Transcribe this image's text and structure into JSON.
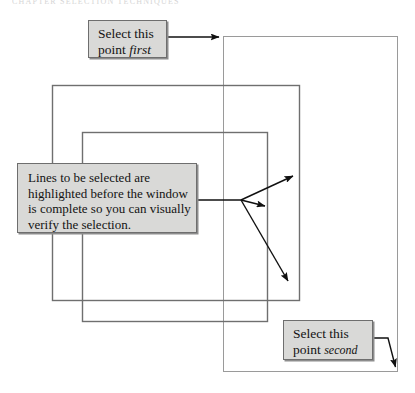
{
  "figure": {
    "ghost_header": "CHAPTER  SELECTION  TECHNIQUES",
    "callout_first": {
      "line1": "Select this",
      "line2_prefix": "point ",
      "line2_emphasis": "first"
    },
    "callout_second": {
      "line1": "Select this",
      "line2_prefix": "point ",
      "line2_emphasis": "second"
    },
    "callout_lines": {
      "line1": "Lines to be selected are",
      "line2": "highlighted before the window",
      "line3": "is complete so you can visually",
      "line4": "verify the selection."
    },
    "colors": {
      "page_background": "#ffffff",
      "callout_fill": "#d9d9d7",
      "callout_border": "#6e6e6e",
      "callout_shadow": "#8d8d8d",
      "window_stroke": "#6f6f6f",
      "selection_stroke": "#9a9a9a",
      "arrow_stroke": "#101010"
    },
    "shapes": {
      "selection_window": {
        "x": 223,
        "y": 36,
        "width": 175,
        "height": 336
      },
      "window_back": {
        "x": 52,
        "y": 85,
        "width": 248,
        "height": 216
      },
      "window_front": {
        "x": 82,
        "y": 132,
        "width": 186,
        "height": 190
      }
    },
    "arrows": {
      "first_point": {
        "from_x": 167,
        "from_y": 37,
        "to_x": 221,
        "to_y": 37
      },
      "second_point": {
        "from_x": 373,
        "from_y": 338,
        "elbow_x": 388,
        "elbow_y": 338,
        "to_x": 397,
        "to_y": 371
      },
      "fan_origin": {
        "x": 241,
        "y": 200
      },
      "fan_targets": [
        {
          "x": 296,
          "y": 174
        },
        {
          "x": 268,
          "y": 207
        },
        {
          "x": 291,
          "y": 284
        }
      ],
      "lines_leader": {
        "from_x": 197,
        "from_y": 200,
        "to_x": 241,
        "to_y": 200
      }
    }
  }
}
